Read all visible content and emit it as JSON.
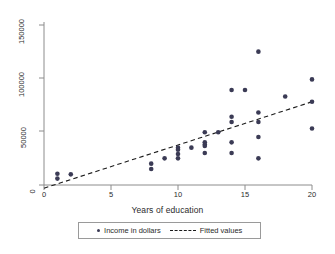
{
  "chart_data": {
    "type": "scatter",
    "title": "",
    "xlabel": "Years of education",
    "ylabel": "",
    "xlim": [
      -0.8,
      21.0
    ],
    "ylim": [
      -8000,
      158000
    ],
    "grid": false,
    "xticks": [
      0,
      5,
      10,
      15,
      20
    ],
    "xtick_labels": [
      "0",
      "5",
      "10",
      "15",
      "20"
    ],
    "yticks": [
      0,
      50000,
      100000,
      150000
    ],
    "ytick_labels": [
      "0",
      "50000",
      "100000",
      "150000"
    ],
    "legend_position": "below-axis",
    "series": [
      {
        "name": "Income in dollars",
        "type": "scatter",
        "marker": "circle",
        "color": "#3b3b55",
        "points": [
          [
            1,
            10500
          ],
          [
            1,
            6000
          ],
          [
            2,
            10000
          ],
          [
            8,
            20000
          ],
          [
            8,
            15000
          ],
          [
            9,
            25000
          ],
          [
            10,
            35000
          ],
          [
            10,
            33000
          ],
          [
            10,
            29000
          ],
          [
            10,
            25000
          ],
          [
            11,
            35000
          ],
          [
            12,
            49500
          ],
          [
            12,
            40000
          ],
          [
            12,
            38000
          ],
          [
            12,
            36500
          ],
          [
            12,
            30000
          ],
          [
            13,
            49500
          ],
          [
            14,
            89000
          ],
          [
            14,
            64000
          ],
          [
            14,
            59000
          ],
          [
            14,
            40000
          ],
          [
            14,
            30000
          ],
          [
            15,
            89000
          ],
          [
            16,
            125000
          ],
          [
            16,
            68000
          ],
          [
            16,
            59000
          ],
          [
            16,
            45000
          ],
          [
            16,
            25000
          ],
          [
            18,
            83000
          ],
          [
            20,
            99000
          ],
          [
            20,
            78000
          ],
          [
            20,
            53000
          ]
        ]
      },
      {
        "name": "Fitted values",
        "type": "line",
        "style": "dashed",
        "color": "#1a1a1a",
        "endpoints": [
          [
            0,
            -3000
          ],
          [
            20,
            78000
          ]
        ],
        "slope": 4050,
        "intercept": -3000
      }
    ]
  },
  "axis": {
    "x_title": "Years of education",
    "x_tick_labels": [
      "0",
      "5",
      "10",
      "15",
      "20"
    ],
    "y_tick_labels": [
      "0",
      "50000",
      "100000",
      "150000"
    ]
  },
  "legend": {
    "scatter_label": "Income in dollars",
    "line_label": "Fitted values"
  },
  "colors": {
    "marker": "#3b3b55",
    "fit_line": "#1a1a1a",
    "axis": "#8c8c8c",
    "text": "#2b2b2b",
    "background": "#ffffff"
  }
}
